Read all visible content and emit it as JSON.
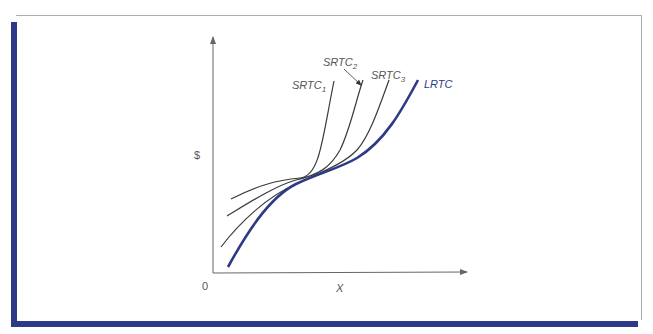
{
  "colors": {
    "frame_accent": "#2e3a87",
    "frame_border": "#a9adb8",
    "lrtc": "#2e3a87",
    "srtc": "#3a3a3a",
    "axis": "#666666"
  },
  "diagram": {
    "y_axis_label": "$",
    "x_axis_label": "X",
    "origin_label": "0",
    "curves": [
      {
        "id": "srtc1",
        "name": "SRTC",
        "subscript": "1",
        "type": "short-run total cost"
      },
      {
        "id": "srtc2",
        "name": "SRTC",
        "subscript": "2",
        "type": "short-run total cost",
        "label_has_pointer": true
      },
      {
        "id": "srtc3",
        "name": "SRTC",
        "subscript": "3",
        "type": "short-run total cost"
      },
      {
        "id": "lrtc",
        "name": "LRTC",
        "subscript": "",
        "type": "long-run total cost (envelope)"
      }
    ]
  }
}
